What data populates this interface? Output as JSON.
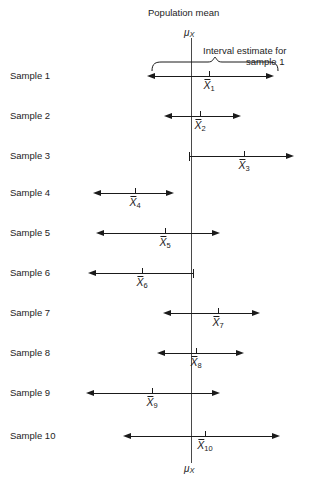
{
  "figure": {
    "title": "Population mean",
    "mu_symbol": "μ",
    "mu_subscript": "X",
    "annotation_line1": "Interval estimate for",
    "annotation_line2": "sample 1",
    "xbar_symbol": "X",
    "axis_color": "#4a4a4a",
    "line_color": "#1a1a1a",
    "text_color": "#1d1d1d"
  },
  "chart_data": {
    "type": "line",
    "title": "Population mean",
    "xlabel": "",
    "ylabel": "",
    "population_mean_x": 191,
    "axis_top": 38,
    "axis_bottom": 463,
    "categories": [
      "Sample 1",
      "Sample 2",
      "Sample 3",
      "Sample 4",
      "Sample 5",
      "Sample 6",
      "Sample 7",
      "Sample 8",
      "Sample 9",
      "Sample 10"
    ],
    "series": [
      {
        "name": "Interval estimates",
        "intervals": [
          {
            "label": "Sample 1",
            "xbar_label": "1",
            "row_y": 76,
            "left_x": 155,
            "right_x": 266,
            "xbar_x": 209,
            "left_end": "arrow",
            "right_end": "arrow",
            "contains_mean": true
          },
          {
            "label": "Sample 2",
            "xbar_label": "2",
            "row_y": 116,
            "left_x": 172,
            "right_x": 233,
            "xbar_x": 200,
            "left_end": "arrow",
            "right_end": "arrow",
            "contains_mean": true
          },
          {
            "label": "Sample 3",
            "xbar_label": "3",
            "row_y": 156,
            "left_x": 189,
            "right_x": 286,
            "xbar_x": 244,
            "left_end": "cap",
            "right_end": "arrow",
            "contains_mean": true
          },
          {
            "label": "Sample 4",
            "xbar_label": "4",
            "row_y": 193,
            "left_x": 101,
            "right_x": 166,
            "xbar_x": 135,
            "left_end": "arrow",
            "right_end": "arrow",
            "contains_mean": false
          },
          {
            "label": "Sample 5",
            "xbar_label": "5",
            "row_y": 233,
            "left_x": 104,
            "right_x": 212,
            "xbar_x": 165,
            "left_end": "arrow",
            "right_end": "arrow",
            "contains_mean": true
          },
          {
            "label": "Sample 6",
            "xbar_label": "6",
            "row_y": 273,
            "left_x": 96,
            "right_x": 194,
            "xbar_x": 142,
            "left_end": "arrow",
            "right_end": "cap",
            "contains_mean": true
          },
          {
            "label": "Sample 7",
            "xbar_label": "7",
            "row_y": 313,
            "left_x": 171,
            "right_x": 252,
            "xbar_x": 218,
            "left_end": "arrow",
            "right_end": "arrow",
            "contains_mean": true
          },
          {
            "label": "Sample 8",
            "xbar_label": "8",
            "row_y": 353,
            "left_x": 165,
            "right_x": 236,
            "xbar_x": 196,
            "left_end": "arrow",
            "right_end": "arrow",
            "contains_mean": true
          },
          {
            "label": "Sample 9",
            "xbar_label": "9",
            "row_y": 393,
            "left_x": 94,
            "right_x": 212,
            "xbar_x": 152,
            "left_end": "arrow",
            "right_end": "arrow",
            "contains_mean": true
          },
          {
            "label": "Sample 10",
            "xbar_label": "10",
            "row_y": 436,
            "left_x": 131,
            "right_x": 272,
            "xbar_x": 205,
            "left_end": "arrow",
            "right_end": "arrow",
            "contains_mean": true
          }
        ]
      }
    ],
    "legend": [],
    "grid": false
  }
}
